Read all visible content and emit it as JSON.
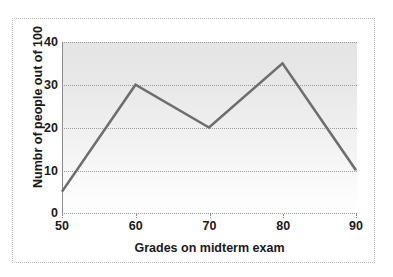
{
  "chart_data": {
    "type": "line",
    "title": "",
    "xlabel": "Grades on midterm exam",
    "ylabel": "Numbr of people out of 100",
    "x": [
      50,
      60,
      70,
      80,
      90
    ],
    "values": [
      5,
      30,
      20,
      35,
      10
    ],
    "series": [
      {
        "name": "",
        "values": [
          5,
          30,
          20,
          35,
          10
        ]
      }
    ],
    "xticklabels": [
      "50",
      "60",
      "70",
      "80",
      "90"
    ],
    "yticklabels": [
      "0",
      "10",
      "20",
      "30",
      "40"
    ],
    "xticks": [
      50,
      60,
      70,
      80,
      90
    ],
    "yticks": [
      0,
      10,
      20,
      30,
      40
    ],
    "xlim": [
      50,
      90
    ],
    "ylim": [
      0,
      40
    ],
    "grid": "horizontal-dotted",
    "legend": "none",
    "line_color": "#6e6e6e",
    "plot_background_top": "#e4e4e4",
    "plot_background_bottom": "#ffffff",
    "text_color": "#1a1a1a",
    "frame_color": "#b9b9b9"
  }
}
